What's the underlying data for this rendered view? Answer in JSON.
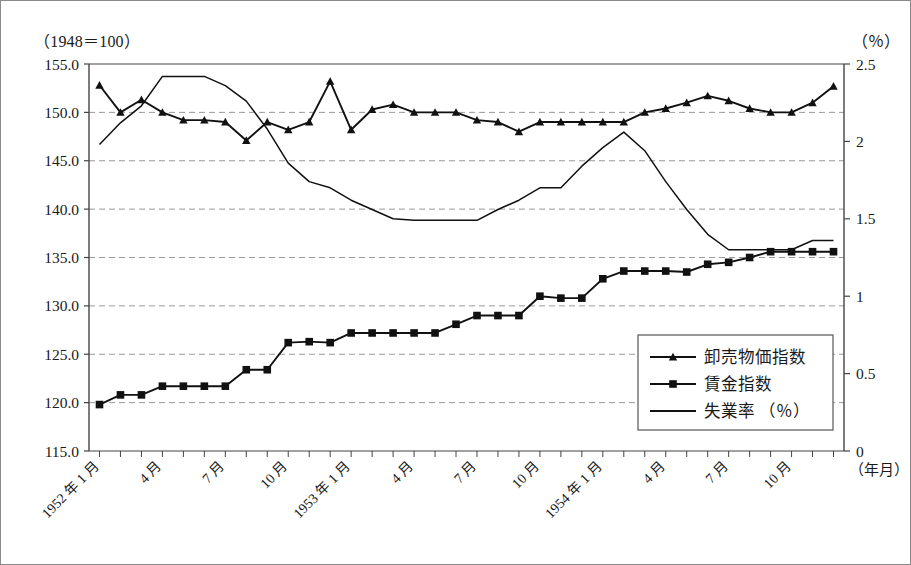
{
  "header": {
    "left_caption": "（1948＝100）",
    "right_caption": "（％）"
  },
  "chart_data": {
    "type": "line",
    "title": "",
    "xlabel": "（年月）",
    "ylabel": "（1948＝100）",
    "y2label": "（％）",
    "ylim": [
      115.0,
      155.0
    ],
    "y2lim": [
      0,
      2.5
    ],
    "yticks": [
      "115.0",
      "120.0",
      "125.0",
      "130.0",
      "135.0",
      "140.0",
      "145.0",
      "150.0",
      "155.0"
    ],
    "ytick_values": [
      115.0,
      120.0,
      125.0,
      130.0,
      135.0,
      140.0,
      145.0,
      150.0,
      155.0
    ],
    "y2ticks": [
      "0",
      "0.5",
      "1",
      "1.5",
      "2",
      "2.5"
    ],
    "y2tick_values": [
      0,
      0.5,
      1,
      1.5,
      2,
      2.5
    ],
    "grid": true,
    "legend_position": "bottom-right",
    "x": [
      "1952-01",
      "1952-02",
      "1952-03",
      "1952-04",
      "1952-05",
      "1952-06",
      "1952-07",
      "1952-08",
      "1952-09",
      "1952-10",
      "1952-11",
      "1952-12",
      "1953-01",
      "1953-02",
      "1953-03",
      "1953-04",
      "1953-05",
      "1953-06",
      "1953-07",
      "1953-08",
      "1953-09",
      "1953-10",
      "1953-11",
      "1953-12",
      "1954-01",
      "1954-02",
      "1954-03",
      "1954-04",
      "1954-05",
      "1954-06",
      "1954-07",
      "1954-08",
      "1954-09",
      "1954-10",
      "1954-11",
      "1954-12"
    ],
    "xtick_labels": [
      {
        "index": 0,
        "text": "1952 年 1 月"
      },
      {
        "index": 3,
        "text": "4 月"
      },
      {
        "index": 6,
        "text": "7 月"
      },
      {
        "index": 9,
        "text": "10 月"
      },
      {
        "index": 12,
        "text": "1953 年 1 月"
      },
      {
        "index": 15,
        "text": "4 月"
      },
      {
        "index": 18,
        "text": "7 月"
      },
      {
        "index": 21,
        "text": "10 月"
      },
      {
        "index": 24,
        "text": "1954 年 1 月"
      },
      {
        "index": 27,
        "text": "4 月"
      },
      {
        "index": 30,
        "text": "7 月"
      },
      {
        "index": 33,
        "text": "10 月"
      }
    ],
    "series": [
      {
        "name": "卸売物価指数",
        "marker": "triangle",
        "axis": "left",
        "values": [
          152.8,
          150.0,
          151.3,
          150.0,
          149.2,
          149.2,
          149.0,
          147.1,
          149.0,
          148.2,
          149.0,
          153.2,
          148.2,
          150.3,
          150.8,
          150.0,
          150.0,
          150.0,
          149.2,
          149.0,
          148.0,
          149.0,
          149.0,
          149.0,
          149.0,
          149.0,
          150.0,
          150.4,
          151.0,
          151.7,
          151.2,
          150.4,
          150.0,
          150.0,
          151.0,
          152.7
        ]
      },
      {
        "name": "賃金指数",
        "marker": "square",
        "axis": "left",
        "values": [
          119.8,
          120.8,
          120.8,
          121.7,
          121.7,
          121.7,
          121.7,
          123.4,
          123.4,
          126.2,
          126.3,
          126.2,
          127.2,
          127.2,
          127.2,
          127.2,
          127.2,
          128.1,
          129.0,
          129.0,
          129.0,
          131.0,
          130.8,
          130.8,
          132.8,
          133.6,
          133.6,
          133.6,
          133.5,
          134.3,
          134.5,
          135.0,
          135.6,
          135.6,
          135.6,
          135.6
        ]
      },
      {
        "name": "失業率（%）",
        "marker": "none",
        "axis": "right",
        "values": [
          1.98,
          2.12,
          2.23,
          2.42,
          2.42,
          2.42,
          2.36,
          2.26,
          2.08,
          1.86,
          1.74,
          1.7,
          1.62,
          1.56,
          1.5,
          1.49,
          1.49,
          1.49,
          1.49,
          1.56,
          1.62,
          1.7,
          1.7,
          1.84,
          1.96,
          2.06,
          1.94,
          1.74,
          1.56,
          1.4,
          1.3,
          1.3,
          1.3,
          1.3,
          1.36,
          1.36
        ]
      }
    ],
    "legend": [
      {
        "label": "卸売物価指数",
        "marker": "triangle"
      },
      {
        "label": "賃金指数",
        "marker": "square"
      },
      {
        "label": "失業率 （％）",
        "marker": "line"
      }
    ]
  }
}
